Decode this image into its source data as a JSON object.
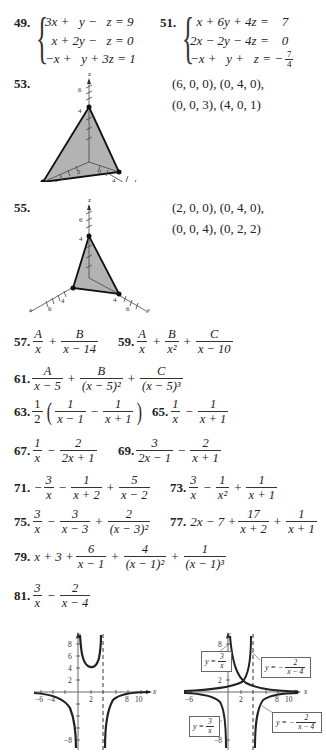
{
  "problems": {
    "p49": {
      "number": "49.",
      "lines": [
        "3x +   y −   z = 9",
        "  x + 2y −   z = 0",
        "−x +   y + 3z = 1"
      ]
    },
    "p51": {
      "number": "51.",
      "lines": [
        "  x + 6y + 4z =    7",
        "2x − 2y − 4z =    0",
        "−x +   y +   z = −"
      ],
      "last_frac": {
        "num": "7",
        "den": "4"
      }
    },
    "p53": {
      "number": "53.",
      "points_line1": "(6, 0, 0), (0, 4, 0),",
      "points_line2": "(0, 0, 3), (4, 0, 1)",
      "axis_labels": {
        "z": "z",
        "x": "x",
        "y": "y"
      },
      "ticks": {
        "z6": "6",
        "z4": "4",
        "x2": "2",
        "y2": "2",
        "x6": "6",
        "y4": "4",
        "y6": "6"
      }
    },
    "p55": {
      "number": "55.",
      "points_line1": "(2, 0, 0), (0, 4, 0),",
      "points_line2": "(0, 0, 4), (0, 2, 2)",
      "axis_labels": {
        "z": "z",
        "x": "x",
        "y": "y"
      },
      "ticks": {
        "z6": "6",
        "z4": "4",
        "x4": "4",
        "x6": "6",
        "y4": "4",
        "y6": "6"
      }
    },
    "p57": {
      "number": "57.",
      "t1": {
        "num": "A",
        "den": "x"
      },
      "op1": "+",
      "t2": {
        "num": "B",
        "den": "x − 14"
      }
    },
    "p59": {
      "number": "59.",
      "t1": {
        "num": "A",
        "den": "x"
      },
      "op1": "+",
      "t2": {
        "num": "B",
        "den": "x²"
      },
      "op2": "+",
      "t3": {
        "num": "C",
        "den": "x − 10"
      }
    },
    "p61": {
      "number": "61.",
      "t1": {
        "num": "A",
        "den": "x − 5"
      },
      "op1": "+",
      "t2": {
        "num": "B",
        "den": "(x − 5)²"
      },
      "op2": "+",
      "t3": {
        "num": "C",
        "den": "(x − 5)³"
      }
    },
    "p63": {
      "number": "63.",
      "coef": {
        "num": "1",
        "den": "2"
      },
      "lparen": "(",
      "t1": {
        "num": "1",
        "den": "x − 1"
      },
      "op1": "−",
      "t2": {
        "num": "1",
        "den": "x + 1"
      },
      "rparen": ")"
    },
    "p65": {
      "number": "65.",
      "t1": {
        "num": "1",
        "den": "x"
      },
      "op1": "−",
      "t2": {
        "num": "1",
        "den": "x + 1"
      }
    },
    "p67": {
      "number": "67.",
      "t1": {
        "num": "1",
        "den": "x"
      },
      "op1": "−",
      "t2": {
        "num": "2",
        "den": "2x + 1"
      }
    },
    "p69": {
      "number": "69.",
      "t1": {
        "num": "3",
        "den": "2x − 1"
      },
      "op1": "−",
      "t2": {
        "num": "2",
        "den": "x + 1"
      }
    },
    "p71": {
      "number": "71.",
      "sign": "−",
      "t1": {
        "num": "3",
        "den": "x"
      },
      "op1": "−",
      "t2": {
        "num": "1",
        "den": "x + 2"
      },
      "op2": "+",
      "t3": {
        "num": "5",
        "den": "x − 2"
      }
    },
    "p73": {
      "number": "73.",
      "t1": {
        "num": "3",
        "den": "x"
      },
      "op1": "−",
      "t2": {
        "num": "1",
        "den": "x²"
      },
      "op2": "+",
      "t3": {
        "num": "1",
        "den": "x + 1"
      }
    },
    "p75": {
      "number": "75.",
      "t1": {
        "num": "3",
        "den": "x"
      },
      "op1": "−",
      "t2": {
        "num": "3",
        "den": "x − 3"
      },
      "op2": "+",
      "t3": {
        "num": "2",
        "den": "(x − 3)²"
      }
    },
    "p77": {
      "number": "77.",
      "lead": "2x − 7 +",
      "t1": {
        "num": "17",
        "den": "x + 2"
      },
      "op1": "+",
      "t2": {
        "num": "1",
        "den": "x + 1"
      }
    },
    "p79": {
      "number": "79.",
      "lead": "x + 3 +",
      "t1": {
        "num": "6",
        "den": "x − 1"
      },
      "op1": "+",
      "t2": {
        "num": "4",
        "den": "(x − 1)²"
      },
      "op2": "+",
      "t3": {
        "num": "1",
        "den": "(x − 1)³"
      }
    },
    "p81": {
      "number": "81.",
      "t1": {
        "num": "3",
        "den": "x"
      },
      "op1": "−",
      "t2": {
        "num": "2",
        "den": "x − 4"
      }
    }
  },
  "graphs": {
    "left": {
      "axis_x": "x",
      "axis_y": "y",
      "x_ticks": [
        "−6",
        "−4",
        "2",
        "8",
        "10"
      ],
      "y_ticks": [
        "8",
        "6",
        "4",
        "2",
        "−8"
      ]
    },
    "right": {
      "axis_x": "x",
      "axis_y": "y",
      "x_ticks": [
        "−6",
        "2",
        "8",
        "10"
      ],
      "y_ticks": [
        "8",
        "2",
        "−8"
      ],
      "labels": {
        "ul": {
          "pre": "y =",
          "num": "3",
          "den": "x"
        },
        "ur": {
          "pre": "y = −",
          "num": "2",
          "den": "x − 4"
        },
        "ll": {
          "pre": "y =",
          "num": "3",
          "den": "x"
        },
        "lr": {
          "pre": "y = −",
          "num": "2",
          "den": "x − 4"
        }
      }
    }
  }
}
